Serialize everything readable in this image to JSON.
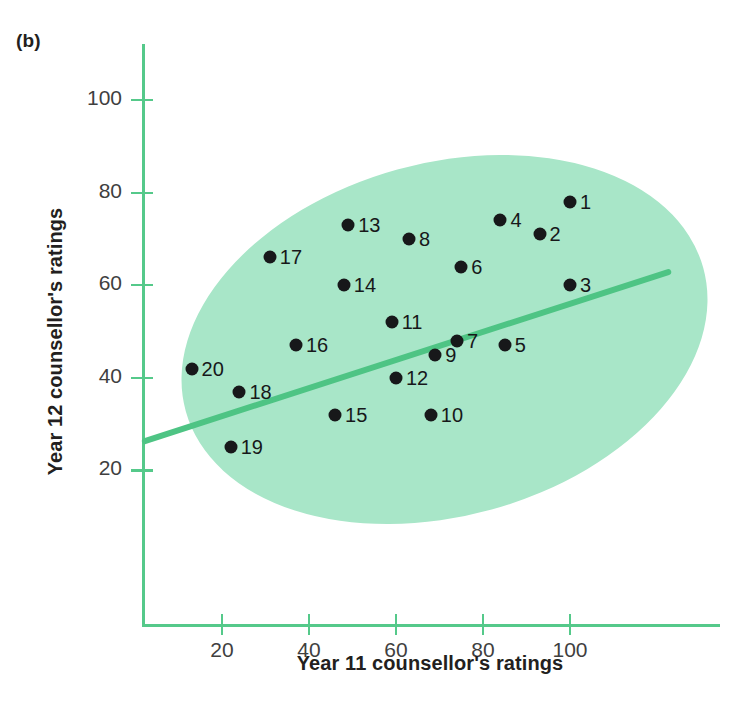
{
  "panel": {
    "label": "(b)"
  },
  "colors": {
    "axis": "#55c98a",
    "envelope": "#a8e6c8",
    "trendline": "#4ec484",
    "point": "#17181a",
    "text": "#231f20",
    "ticktext": "#3f3f3f"
  },
  "chart_data": {
    "type": "scatter",
    "title": "",
    "xlabel": "Year 11 counsellor's ratings",
    "ylabel": "Year 12 counsellor's ratings",
    "xlim": [
      0,
      113
    ],
    "ylim": [
      0,
      112
    ],
    "xticks": [
      20,
      40,
      60,
      80,
      100
    ],
    "yticks": [
      20,
      40,
      60,
      80,
      100
    ],
    "xtick_labels": [
      "20",
      "40",
      "60",
      "80",
      "100"
    ],
    "ytick_labels": [
      "20",
      "40",
      "60",
      "80",
      "100"
    ],
    "grid": false,
    "legend": null,
    "annotations": [
      "(b)"
    ],
    "point_labels_shown": true,
    "points": [
      {
        "label": "1",
        "x": 100,
        "y": 78
      },
      {
        "label": "2",
        "x": 93,
        "y": 71
      },
      {
        "label": "3",
        "x": 100,
        "y": 60
      },
      {
        "label": "4",
        "x": 84,
        "y": 74
      },
      {
        "label": "5",
        "x": 85,
        "y": 47
      },
      {
        "label": "6",
        "x": 75,
        "y": 64
      },
      {
        "label": "7",
        "x": 74,
        "y": 48
      },
      {
        "label": "8",
        "x": 63,
        "y": 70
      },
      {
        "label": "9",
        "x": 69,
        "y": 45
      },
      {
        "label": "10",
        "x": 68,
        "y": 32
      },
      {
        "label": "11",
        "x": 59,
        "y": 52
      },
      {
        "label": "12",
        "x": 60,
        "y": 40
      },
      {
        "label": "13",
        "x": 49,
        "y": 73
      },
      {
        "label": "14",
        "x": 48,
        "y": 60
      },
      {
        "label": "15",
        "x": 46,
        "y": 32
      },
      {
        "label": "16",
        "x": 37,
        "y": 47
      },
      {
        "label": "17",
        "x": 31,
        "y": 66
      },
      {
        "label": "18",
        "x": 24,
        "y": 37
      },
      {
        "label": "19",
        "x": 22,
        "y": 25
      },
      {
        "label": "20",
        "x": 13,
        "y": 42
      }
    ],
    "trendline": {
      "type": "linear-fit",
      "x_start": 0,
      "y_start": 32,
      "x_end": 111,
      "y_end": 66
    },
    "envelope": {
      "type": "ellipse",
      "center_x": 56,
      "center_y": 52,
      "rotation_deg": -15.5,
      "description": "shaded ellipse enclosing all data points"
    }
  }
}
